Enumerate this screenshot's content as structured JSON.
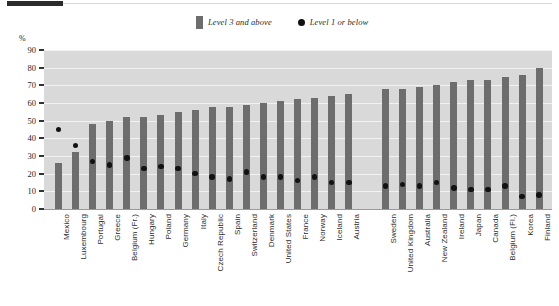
{
  "chart_data": {
    "type": "bar",
    "title": "",
    "subtitle": "",
    "xlabel": "",
    "ylabel": "%",
    "ylim": [
      0,
      90
    ],
    "yticks": [
      0,
      10,
      20,
      30,
      40,
      50,
      60,
      70,
      80,
      90
    ],
    "grid": true,
    "legend_position": "top-center",
    "categories": [
      "Mexico",
      "Luxembourg",
      "Portugal",
      "Greece",
      "Belgium (Fr.)",
      "Hungary",
      "Poland",
      "Germany",
      "Italy",
      "Czech Republic",
      "Spain",
      "Switzerland",
      "Denmark",
      "United States",
      "France",
      "Norway",
      "Iceland",
      "Austria",
      "Sweden",
      "United Kingdom",
      "Australia",
      "New Zealand",
      "Ireland",
      "Japan",
      "Canada",
      "Belgium (Fl.)",
      "Korea",
      "Finland"
    ],
    "group_break_after_index": 17,
    "series": [
      {
        "name": "Level 3 and above",
        "type": "bar",
        "color": "#6d6d6d",
        "values": [
          26,
          32,
          48,
          50,
          52,
          52,
          53,
          55,
          56,
          58,
          58,
          59,
          60,
          61,
          62,
          63,
          64,
          65,
          68,
          68,
          69,
          70,
          72,
          73,
          73,
          75,
          76,
          80
        ]
      },
      {
        "name": "Level 1 or below",
        "type": "scatter",
        "color": "#121212",
        "values": [
          45,
          36,
          27,
          25,
          29,
          23,
          24,
          23,
          20,
          18,
          17,
          21,
          18,
          18,
          16,
          18,
          15,
          15,
          13,
          14,
          13,
          15,
          12,
          11,
          11,
          13,
          7,
          8
        ]
      }
    ]
  },
  "legend": {
    "entries": [
      {
        "label": "Level 3 and above",
        "marker": "square-swatch"
      },
      {
        "label": "Level 1 or below",
        "marker": "circle-dot"
      }
    ]
  },
  "axis": {
    "unit_label": "%"
  },
  "colors": {
    "bar": "#6d6d6d",
    "dot": "#121212",
    "plot_background": "#d9d9d9",
    "gridline": "#f2f2f2",
    "rule": "#2b2b2b"
  }
}
